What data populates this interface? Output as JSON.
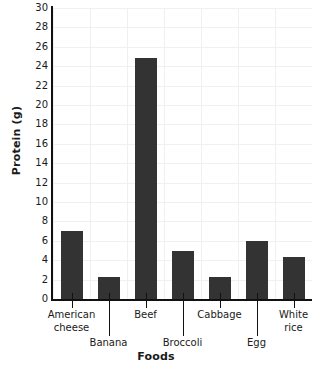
{
  "chart_data": {
    "type": "bar",
    "title": "",
    "xlabel": "Foods",
    "ylabel": "Protein (g)",
    "categories": [
      "American cheese",
      "Banana",
      "Beef",
      "Broccoli",
      "Cabbage",
      "Egg",
      "White rice"
    ],
    "values": [
      7,
      2.3,
      24.8,
      5,
      2.3,
      6,
      4.3
    ],
    "ylim": [
      0,
      30
    ],
    "ytick_step": 2,
    "yticks": [
      0,
      2,
      4,
      6,
      8,
      10,
      12,
      14,
      16,
      18,
      20,
      22,
      24,
      26,
      28,
      30
    ],
    "ytick_labels": [
      "0",
      "2",
      "4",
      "6",
      "8",
      "10",
      "12",
      "14",
      "16",
      "18",
      "20",
      "22",
      "24",
      "26",
      "28",
      "30"
    ],
    "grid": true,
    "legend": false,
    "bar_color": "#333333",
    "grid_color": "#f0f0f0",
    "axis_color": "#111111"
  },
  "axis": {
    "y_title": "Protein (g)",
    "x_title": "Foods"
  },
  "x_labels": [
    {
      "text": "American\ncheese",
      "row": 0
    },
    {
      "text": "Banana",
      "row": 1
    },
    {
      "text": "Beef",
      "row": 0
    },
    {
      "text": "Broccoli",
      "row": 1
    },
    {
      "text": "Cabbage",
      "row": 0
    },
    {
      "text": "Egg",
      "row": 1
    },
    {
      "text": "White\nrice",
      "row": 0
    }
  ]
}
